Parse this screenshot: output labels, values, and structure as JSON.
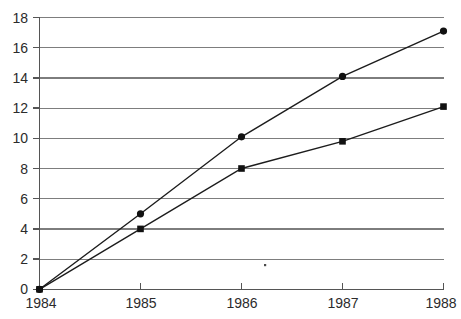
{
  "chart_data": {
    "type": "line",
    "title": "",
    "subtitle": "",
    "xlabel": "",
    "ylabel": "",
    "categories": [
      "1984",
      "1985",
      "1986",
      "1987",
      "1988"
    ],
    "x": [
      1984,
      1985,
      1986,
      1987,
      1988
    ],
    "series": [
      {
        "name": "series-1",
        "marker": "circle",
        "color": "#111111",
        "values": [
          0,
          5.0,
          10.1,
          14.1,
          17.1
        ]
      },
      {
        "name": "series-2",
        "marker": "square",
        "color": "#111111",
        "values": [
          0,
          4.0,
          8.0,
          9.8,
          12.1
        ]
      }
    ],
    "ylim": [
      0,
      18
    ],
    "xlim": [
      1984,
      1988
    ],
    "yticks": [
      0,
      2,
      4,
      6,
      8,
      10,
      12,
      14,
      16,
      18
    ],
    "ytick_labels": [
      "0",
      "2",
      "4",
      "6",
      "8",
      "10",
      "12",
      "14",
      "16",
      "18"
    ],
    "xticks": [
      1984,
      1985,
      1986,
      1987,
      1988
    ],
    "xtick_labels": [
      "1984",
      "1985",
      "1986",
      "1987",
      "1988"
    ],
    "grid": true,
    "grid_axis": "y",
    "legend": false,
    "legend_position": "none",
    "annotations": [],
    "colors": {
      "gridline": "#7d7d7d",
      "axis": "#555555",
      "line": "#1c1c1c",
      "marker": "#111111",
      "background": "#ffffff",
      "text": "#2b2b2b"
    }
  },
  "axes": {
    "y": {
      "t0": {
        "label": "18"
      },
      "t1": {
        "label": "16"
      },
      "t2": {
        "label": "14"
      },
      "t3": {
        "label": "12"
      },
      "t4": {
        "label": "10"
      },
      "t5": {
        "label": "8"
      },
      "t6": {
        "label": "6"
      },
      "t7": {
        "label": "4"
      },
      "t8": {
        "label": "2"
      },
      "t9": {
        "label": "0"
      }
    },
    "x": {
      "t0": {
        "label": "1984"
      },
      "t1": {
        "label": "1985"
      },
      "t2": {
        "label": "1986"
      },
      "t3": {
        "label": "1987"
      },
      "t4": {
        "label": "1988"
      }
    }
  }
}
